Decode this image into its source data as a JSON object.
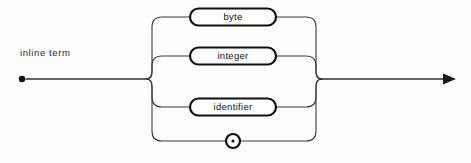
{
  "diagram": {
    "kind": "railroad-syntax-diagram",
    "caption": "inline term",
    "colors": {
      "background": "#fdfdfd",
      "rail": "#3a3a3a",
      "node_stroke": "#111111",
      "node_fill": "#ffffff",
      "text": "#0f0f0f"
    },
    "start": {
      "name": "start-dot",
      "x": 22,
      "y": 79
    },
    "end": {
      "name": "end-arrow",
      "x": 455,
      "y": 79
    },
    "fork_left_x": 152,
    "fork_right_x": 316,
    "main_line_y": 79,
    "branches": [
      {
        "id": "branch-byte",
        "label": "byte",
        "shape": "stadium",
        "y": 17,
        "box_x": 190,
        "box_width": 86,
        "box_height": 17
      },
      {
        "id": "branch-integer",
        "label": "integer",
        "shape": "stadium",
        "y": 56,
        "box_x": 190,
        "box_width": 86,
        "box_height": 17
      },
      {
        "id": "branch-identifier",
        "label": "identifier",
        "shape": "stadium",
        "y": 107,
        "box_x": 190,
        "box_width": 86,
        "box_height": 17
      },
      {
        "id": "branch-dot",
        "label": "",
        "shape": "circle-with-dot",
        "y": 141,
        "circle_cx": 233,
        "circle_r": 7
      }
    ]
  }
}
